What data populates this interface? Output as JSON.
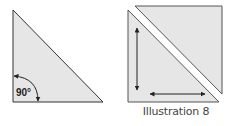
{
  "figure": {
    "caption": "Illustration 8",
    "left_shape": {
      "type": "right-triangle",
      "angle_label": "90°",
      "fill": "#e6e6e6",
      "stroke": "#333333"
    },
    "right_shape": {
      "type": "square-split-into-two-triangles",
      "fill": "#e6e6e6",
      "stroke": "#333333",
      "arrows": [
        "vertical-double-arrow",
        "horizontal-double-arrow"
      ]
    }
  }
}
